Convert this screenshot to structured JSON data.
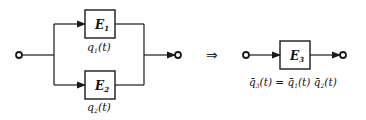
{
  "diagram": {
    "left": {
      "title": "Parallel system",
      "blocks": [
        {
          "name": "E",
          "sub": "1",
          "reliability_label": "q",
          "reliability_sub": "1",
          "reliability_arg": "(t)"
        },
        {
          "name": "E",
          "sub": "2",
          "reliability_label": "q",
          "reliability_sub": "2",
          "reliability_arg": "(t)"
        }
      ]
    },
    "implies_symbol": "⇒",
    "right": {
      "block": {
        "name": "E",
        "sub": "3"
      },
      "formula": {
        "lhs": "q̄",
        "lhs_sub": "3",
        "lhs_arg": "(t) = ",
        "t1": "q̄",
        "t1_sub": "1",
        "t1_arg": "(t) ",
        "t2": "q̄",
        "t2_sub": "2",
        "t2_arg": "(t)"
      }
    },
    "colors": {
      "line": "#1a1a1a",
      "background": "#ffffff"
    }
  }
}
